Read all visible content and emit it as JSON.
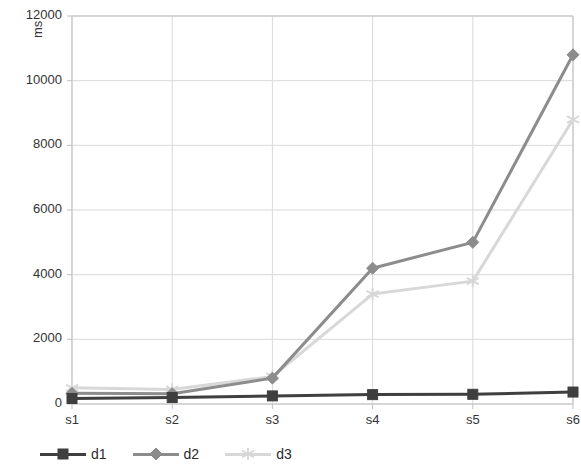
{
  "chart_data": {
    "type": "line",
    "title": "",
    "xlabel": "",
    "ylabel": "ms",
    "categories": [
      "s1",
      "s2",
      "s3",
      "s4",
      "s5",
      "s6"
    ],
    "ylim": [
      0,
      12000
    ],
    "ytick_labels": [
      "0",
      "2000",
      "4000",
      "6000",
      "8000",
      "10000",
      "12000"
    ],
    "ytick_values": [
      0,
      2000,
      4000,
      6000,
      8000,
      10000,
      12000
    ],
    "grid": true,
    "legend_position": "bottom-left",
    "series": [
      {
        "name": "d1",
        "color": "#3f3f3f",
        "marker": "square",
        "values": [
          170,
          200,
          250,
          290,
          300,
          370
        ]
      },
      {
        "name": "d2",
        "color": "#8c8c8c",
        "marker": "diamond",
        "values": [
          330,
          320,
          800,
          4200,
          5000,
          10800
        ]
      },
      {
        "name": "d3",
        "color": "#d8d8d8",
        "marker": "star",
        "values": [
          500,
          450,
          850,
          3400,
          3800,
          8800
        ]
      }
    ]
  },
  "legend": {
    "items": [
      {
        "label": "d1"
      },
      {
        "label": "d2"
      },
      {
        "label": "d3"
      }
    ]
  },
  "colors": {
    "d1": "#3f3f3f",
    "d2": "#8c8c8c",
    "d3": "#d8d8d8",
    "grid": "#d9d9d9",
    "frame": "#bfbfbf",
    "text": "#333333"
  }
}
